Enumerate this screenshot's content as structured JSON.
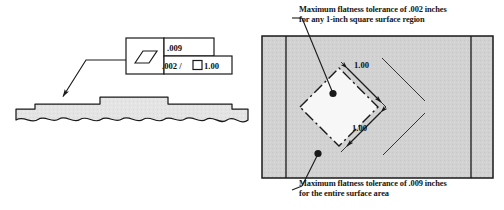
{
  "figure": {
    "type": "gd-t-flatness-illustration",
    "background_color": "#ffffff",
    "line_color": "#1a1a1a",
    "surface_fill": "#d0d0d0",
    "part_fill": "#e2e2e2"
  },
  "feature_control_frame": {
    "symbol_name": "flatness-symbol",
    "top_row_value": ".009",
    "bottom_row_value": ".002 / ",
    "bottom_row_unit_area": "1.00",
    "unit_area_symbol_name": "square-symbol"
  },
  "side_view": {
    "name": "part-side-view-section",
    "break_line": "wavy-break-line",
    "leader": "flatness-leader-arrow"
  },
  "top_view": {
    "name": "part-top-surface-view",
    "unit_square": "rotated-unit-square",
    "dimensions": [
      {
        "label": "1.00"
      },
      {
        "label": "1.00"
      }
    ]
  },
  "annotations": {
    "upper": {
      "line1": "Maximum flatness tolerance of .002 inches",
      "line2": "for any 1-inch square surface region"
    },
    "lower": {
      "line1": "Maximum flatness tolerance of .009 inches",
      "line2": "for the entire surface area"
    }
  }
}
